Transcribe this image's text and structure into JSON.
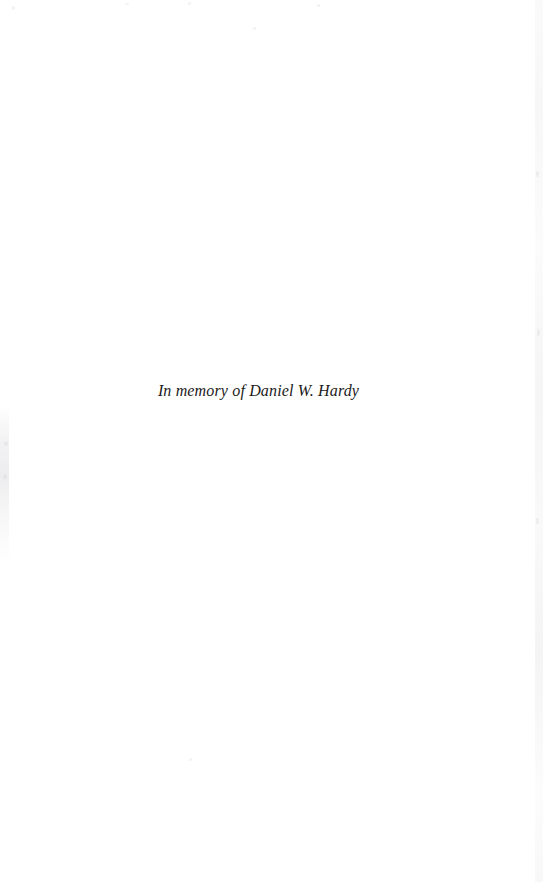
{
  "document": {
    "kind": "book-dedication-page",
    "page_background_color": "#ffffff",
    "ink_color": "#1c1a19"
  },
  "dedication": {
    "text": "In memory of Daniel W. Hardy",
    "style": "italic-serif",
    "alignment": "center"
  },
  "artifacts": {
    "left_edge_label": "",
    "right_edge_label": ""
  }
}
